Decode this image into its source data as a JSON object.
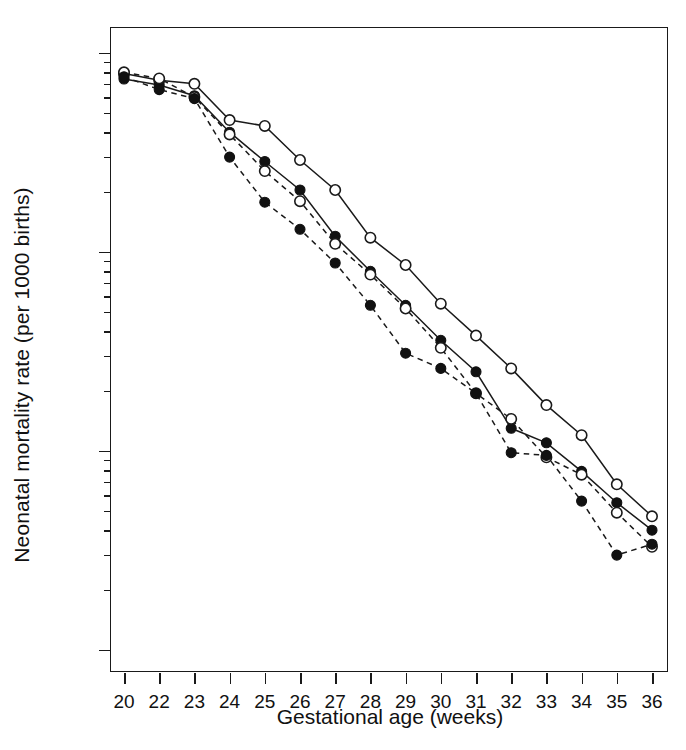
{
  "figure": {
    "background": "#ffffff",
    "ink_color": "#1a1a1a"
  },
  "axes": {
    "x_title": "Gestational age (weeks)",
    "y_title": "Neonatal mortality rate (per 1000 births)",
    "x_tick_labels": [
      "20",
      "22",
      "23",
      "24",
      "25",
      "26",
      "27",
      "28",
      "29",
      "30",
      "31",
      "32",
      "33",
      "34",
      "35",
      "36"
    ],
    "y_tick_labels": [
      "1000",
      "100",
      "10",
      "1"
    ],
    "y_scale": "log",
    "y_major_values": [
      1000,
      100,
      10,
      1
    ],
    "y_minor_values": [
      900,
      800,
      700,
      600,
      500,
      400,
      300,
      200,
      90,
      80,
      70,
      60,
      50,
      40,
      30,
      20,
      9,
      8,
      7,
      6,
      5,
      4,
      3,
      2
    ],
    "y_limits": [
      0.75,
      1450
    ],
    "grid": false,
    "legend": "none"
  },
  "chart_data": {
    "type": "line",
    "title": "",
    "xlabel": "Gestational age (weeks)",
    "ylabel": "Neonatal mortality rate (per 1000 births)",
    "yscale": "log",
    "ylim": [
      0.75,
      1450
    ],
    "grid": false,
    "legend_position": "none",
    "categories": [
      "20",
      "22",
      "23",
      "24",
      "25",
      "26",
      "27",
      "28",
      "29",
      "30",
      "31",
      "32",
      "33",
      "34",
      "35",
      "36"
    ],
    "series": [
      {
        "name": "solid-open-circle",
        "line_style": "solid",
        "marker": "open-circle",
        "values": [
          790,
          730,
          700,
          460,
          430,
          290,
          205,
          118,
          86,
          55,
          38,
          26,
          17,
          12,
          6.8,
          4.7
        ]
      },
      {
        "name": "solid-filled-circle",
        "line_style": "solid",
        "marker": "filled-circle",
        "values": [
          740,
          690,
          610,
          400,
          285,
          205,
          120,
          80,
          54,
          36,
          25,
          13,
          11,
          7.9,
          5.5,
          4.0
        ]
      },
      {
        "name": "dashed-open-circle",
        "line_style": "dashed",
        "marker": "open-circle",
        "values": [
          800,
          745,
          600,
          390,
          255,
          180,
          110,
          77,
          52,
          33,
          19.5,
          14.5,
          9.3,
          7.6,
          4.9,
          3.3
        ]
      },
      {
        "name": "dashed-filled-circle",
        "line_style": "dashed",
        "marker": "filled-circle",
        "values": [
          760,
          655,
          590,
          300,
          178,
          130,
          88,
          54,
          31,
          26,
          19.5,
          9.8,
          9.5,
          5.6,
          3.0,
          3.4
        ]
      }
    ]
  }
}
